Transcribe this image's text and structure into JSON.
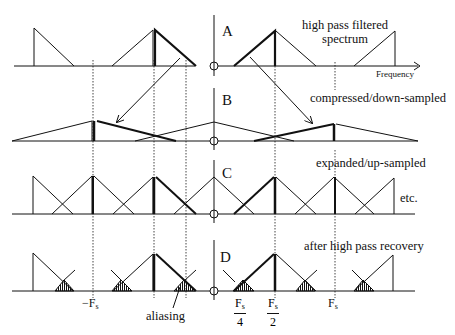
{
  "figure": {
    "panels": [
      {
        "letter": "A",
        "label": "high pass filtered",
        "label_line2": "spectrum"
      },
      {
        "letter": "B",
        "label": "compressed/down-sampled"
      },
      {
        "letter": "C",
        "label": "expanded/up-sampled",
        "note": "etc."
      },
      {
        "letter": "D",
        "label": "after high pass recovery"
      }
    ],
    "axis_label": "Frequency",
    "ticks": {
      "neg_fs": "−F",
      "neg_fs_sub": "s",
      "fs4_num": "F",
      "fs4_sub": "s",
      "fs4_den": "4",
      "fs2_num": "F",
      "fs2_sub": "s",
      "fs2_den": "2",
      "fs": "F",
      "fs_sub": "s"
    },
    "annotation": "aliasing",
    "colors": {
      "line": "#111111",
      "dotted": "#444444",
      "background": "#ffffff"
    }
  }
}
